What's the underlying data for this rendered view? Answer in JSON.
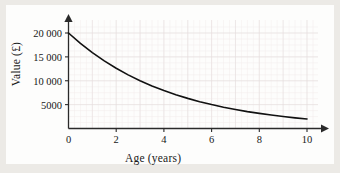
{
  "figure": {
    "background_color": "#eceae6",
    "plate_color": "#fdfdfc",
    "curve_color": "#111111",
    "axis_color": "#2a2a2a",
    "grid_major_color": "#e6dede",
    "grid_minor_color": "#f2ecec"
  },
  "chart_data": {
    "type": "line",
    "title": "",
    "subtitle": "",
    "xlabel": "Age (years)",
    "ylabel": "Value (£)",
    "xlim": [
      0,
      10
    ],
    "ylim": [
      0,
      21500
    ],
    "xticks": [
      0,
      2,
      4,
      6,
      8,
      10
    ],
    "xticklabels": [
      "0",
      "2",
      "4",
      "6",
      "8",
      "10"
    ],
    "yticks": [
      5000,
      10000,
      15000,
      20000
    ],
    "yticklabels": [
      "5000",
      "10 000",
      "15 000",
      "20 000"
    ],
    "grid": true,
    "grid_minor": true,
    "legend": null,
    "annotations": [],
    "axis_arrows": [
      "x-right",
      "y-up"
    ],
    "series": [
      {
        "name": "Value of car",
        "type": "exponential-decay",
        "model": "V = 20000 × 0.794^t",
        "x": [
          0,
          0.5,
          1,
          1.5,
          2,
          2.5,
          3,
          3.5,
          4,
          4.5,
          5,
          5.5,
          6,
          6.5,
          7,
          7.5,
          8,
          8.5,
          9,
          9.5,
          10
        ],
        "y": [
          20000,
          17820,
          15880,
          14150,
          12610,
          11230,
          10010,
          8920,
          7950,
          7080,
          6310,
          5620,
          5010,
          4460,
          3980,
          3540,
          3160,
          2810,
          2505,
          2230,
          1990
        ]
      }
    ]
  }
}
